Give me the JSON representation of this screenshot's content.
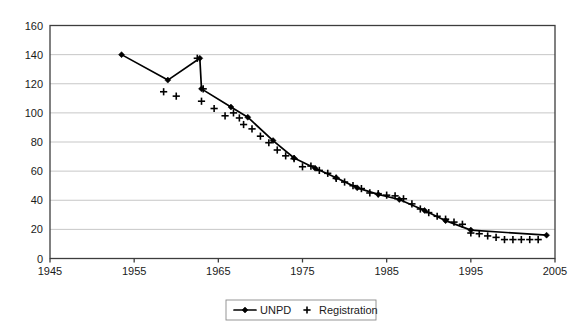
{
  "chart_data": {
    "type": "line",
    "title": "",
    "xlabel": "",
    "ylabel": "",
    "xlim": [
      1945,
      2005
    ],
    "ylim": [
      0,
      160
    ],
    "xticks": [
      1945,
      1955,
      1965,
      1975,
      1985,
      1995,
      2005
    ],
    "yticks": [
      0,
      20,
      40,
      60,
      80,
      100,
      120,
      140,
      160
    ],
    "grid": "horizontal",
    "legend_position": "bottom-center",
    "series": [
      {
        "name": "UNPD",
        "marker": "diamond",
        "style": "line-with-markers",
        "color": "#000000",
        "points": [
          [
            1953.5,
            140.0
          ],
          [
            1959.0,
            122.5
          ],
          [
            1962.8,
            137.5
          ],
          [
            1963.0,
            116.5
          ],
          [
            1966.5,
            104.0
          ],
          [
            1968.5,
            97.0
          ],
          [
            1971.5,
            81.0
          ],
          [
            1974.0,
            69.0
          ],
          [
            1976.5,
            62.0
          ],
          [
            1979.0,
            55.5
          ],
          [
            1981.5,
            48.5
          ],
          [
            1984.0,
            44.0
          ],
          [
            1986.5,
            40.5
          ],
          [
            1989.5,
            33.0
          ],
          [
            1992.0,
            26.0
          ],
          [
            1995.0,
            19.5
          ],
          [
            2004.0,
            16.0
          ]
        ]
      },
      {
        "name": "Registration",
        "marker": "plus",
        "style": "markers-only",
        "color": "#000000",
        "points": [
          [
            1958.5,
            114.5
          ],
          [
            1960.0,
            111.5
          ],
          [
            1962.5,
            137.5
          ],
          [
            1963.2,
            116.5
          ],
          [
            1963.0,
            108.0
          ],
          [
            1964.5,
            103.0
          ],
          [
            1965.8,
            98.0
          ],
          [
            1966.8,
            100.0
          ],
          [
            1967.5,
            96.5
          ],
          [
            1968.0,
            92.0
          ],
          [
            1969.0,
            89.0
          ],
          [
            1970.0,
            84.0
          ],
          [
            1971.0,
            79.5
          ],
          [
            1972.0,
            74.5
          ],
          [
            1973.0,
            70.5
          ],
          [
            1974.0,
            68.5
          ],
          [
            1975.0,
            63.0
          ],
          [
            1976.0,
            63.5
          ],
          [
            1977.0,
            60.5
          ],
          [
            1978.0,
            58.5
          ],
          [
            1979.0,
            55.0
          ],
          [
            1980.0,
            52.5
          ],
          [
            1981.0,
            50.0
          ],
          [
            1982.0,
            48.0
          ],
          [
            1983.0,
            45.0
          ],
          [
            1984.0,
            44.5
          ],
          [
            1985.0,
            43.5
          ],
          [
            1986.0,
            43.0
          ],
          [
            1987.0,
            41.0
          ],
          [
            1988.0,
            37.5
          ],
          [
            1989.0,
            34.0
          ],
          [
            1990.0,
            31.5
          ],
          [
            1991.0,
            29.0
          ],
          [
            1992.0,
            27.0
          ],
          [
            1993.0,
            25.0
          ],
          [
            1994.0,
            23.5
          ],
          [
            1995.0,
            17.5
          ],
          [
            1996.0,
            17.0
          ],
          [
            1997.0,
            15.5
          ],
          [
            1998.0,
            14.5
          ],
          [
            1999.0,
            13.0
          ],
          [
            2000.0,
            13.0
          ],
          [
            2001.0,
            13.0
          ],
          [
            2002.0,
            13.0
          ],
          [
            2003.0,
            13.0
          ]
        ]
      }
    ]
  },
  "legend": {
    "items": [
      {
        "label": "UNPD",
        "marker": "line-diamond"
      },
      {
        "label": "Registration",
        "marker": "plus"
      }
    ]
  },
  "axes": {
    "y_tick_labels": [
      "0",
      "20",
      "40",
      "60",
      "80",
      "100",
      "120",
      "140",
      "160"
    ],
    "x_tick_labels": [
      "1945",
      "1955",
      "1965",
      "1975",
      "1985",
      "1995",
      "2005"
    ]
  },
  "colors": {
    "series": "#000000",
    "gridline": "#b9b9b9",
    "axis": "#3d3d3d",
    "background": "#ffffff"
  }
}
